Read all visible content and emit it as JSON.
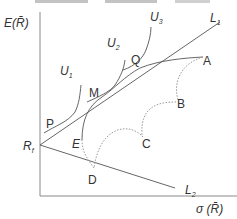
{
  "diagram": {
    "type": "efficient frontier with indifference curves",
    "axes": {
      "y_label": "E(R̄)",
      "x_label": "σ (R̄)"
    },
    "lines": {
      "L1": {
        "label": "L",
        "sub": "1"
      },
      "L2": {
        "label": "L",
        "sub": "2"
      }
    },
    "curves": {
      "U1": {
        "label": "U",
        "sub": "1"
      },
      "U2": {
        "label": "U",
        "sub": "2"
      },
      "U3": {
        "label": "U",
        "sub": "3"
      }
    },
    "points": {
      "Rf": {
        "label": "R",
        "sub": "f"
      },
      "P": "P",
      "M": "M",
      "Q": "Q",
      "A": "A",
      "B": "B",
      "C": "C",
      "D": "D",
      "E": "E"
    },
    "colors": {
      "line": "#555555",
      "dotted": "#999999",
      "text": "#333333"
    }
  }
}
